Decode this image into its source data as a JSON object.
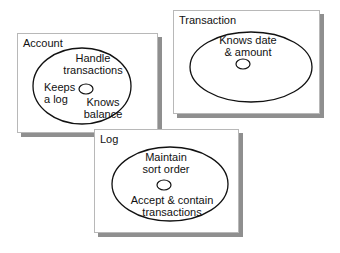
{
  "diagram": {
    "type": "object-responsibility diagram",
    "objects": [
      {
        "name": "Account",
        "responsibilities": [
          "Handle transactions",
          "Keeps a log",
          "Knows balance"
        ],
        "lines": {
          "handle_1": "Handle",
          "handle_2": "transactions",
          "keeps_1": "Keeps",
          "keeps_2": "a log",
          "knows_1": "Knows",
          "knows_2": "balance"
        }
      },
      {
        "name": "Transaction",
        "responsibilities": [
          "Knows date & amount"
        ],
        "lines": {
          "knows_1": "Knows date",
          "knows_2": "& amount"
        }
      },
      {
        "name": "Log",
        "responsibilities": [
          "Maintain sort order",
          "Accept & contain transactions"
        ],
        "lines": {
          "maintain_1": "Maintain",
          "maintain_2": "sort order",
          "accept_1": "Accept & contain",
          "accept_2": "transactions"
        }
      }
    ],
    "colors": {
      "background": "#ffffff",
      "card_border": "#b8b8b8",
      "card_shadow": "#8f8f8f",
      "stroke": "#111111"
    }
  }
}
